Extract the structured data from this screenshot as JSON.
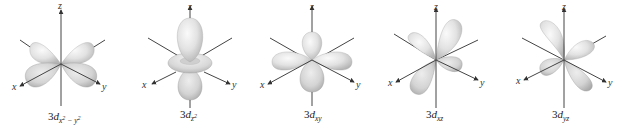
{
  "figure": {
    "orbitals": [
      {
        "id": "dx2-y2",
        "prefix": "3",
        "main": "d",
        "sub": "x",
        "sup1": "2",
        "mid": " − y",
        "sup2": "2",
        "axes": [
          "x",
          "y",
          "z"
        ]
      },
      {
        "id": "dz2",
        "prefix": "3",
        "main": "d",
        "sub": "z",
        "sup1": "2",
        "mid": "",
        "sup2": "",
        "axes": [
          "x",
          "y",
          "z"
        ]
      },
      {
        "id": "dxy",
        "prefix": "3",
        "main": "d",
        "sub": "xy",
        "sup1": "",
        "mid": "",
        "sup2": "",
        "axes": [
          "x",
          "y",
          "z"
        ]
      },
      {
        "id": "dxz",
        "prefix": "3",
        "main": "d",
        "sub": "xz",
        "sup1": "",
        "mid": "",
        "sup2": "",
        "axes": [
          "x",
          "y",
          "z"
        ]
      },
      {
        "id": "dyz",
        "prefix": "3",
        "main": "d",
        "sub": "yz",
        "sup1": "",
        "mid": "",
        "sup2": "",
        "axes": [
          "x",
          "y",
          "z"
        ]
      }
    ],
    "colors": {
      "lobe_light": "#f2f2f2",
      "lobe_dark": "#b8b8b8",
      "axis": "#444444",
      "text": "#222222"
    }
  }
}
